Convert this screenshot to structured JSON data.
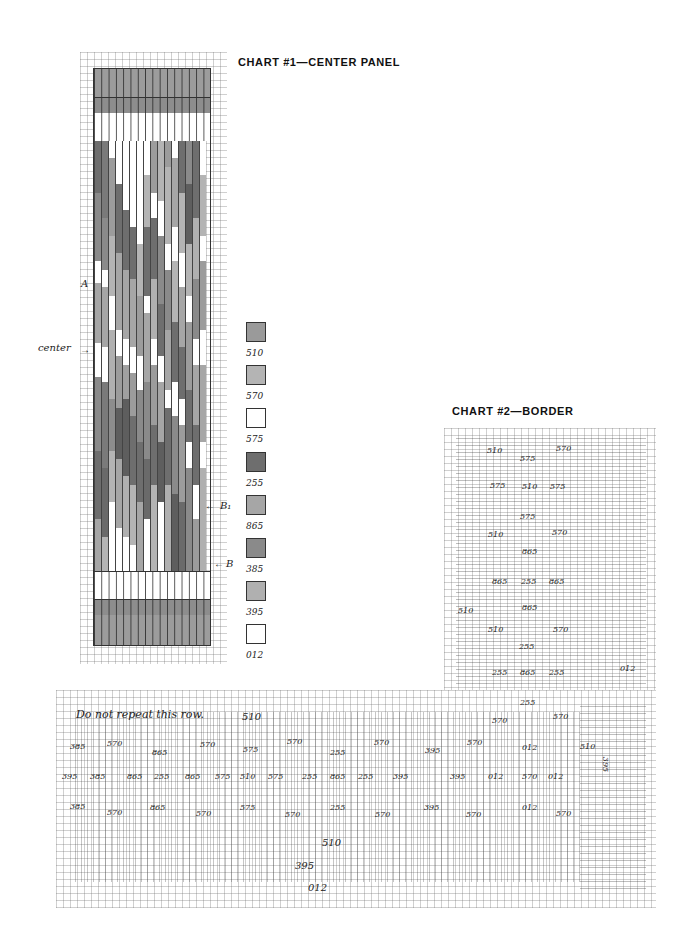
{
  "chart1": {
    "title": "CHART #1—CENTER PANEL",
    "annotations": {
      "center": "center",
      "a": "A",
      "b1": "B₁",
      "b": "B"
    },
    "legend": [
      {
        "code": "510",
        "color": "#9a9a9a"
      },
      {
        "code": "570",
        "color": "#b4b4b4"
      },
      {
        "code": "575",
        "color": "#ffffff"
      },
      {
        "code": "255",
        "color": "#6e6e6e"
      },
      {
        "code": "865",
        "color": "#a6a6a6"
      },
      {
        "code": "385",
        "color": "#8a8a8a"
      },
      {
        "code": "395",
        "color": "#b0b0b0"
      },
      {
        "code": "012",
        "color": "#ffffff"
      }
    ]
  },
  "chart2": {
    "title": "CHART #2—BORDER",
    "note": "Do not repeat this row.",
    "vertical_labels": [
      {
        "text": "510",
        "x": 487,
        "y": 452
      },
      {
        "text": "570",
        "x": 556,
        "y": 450
      },
      {
        "text": "575",
        "x": 520,
        "y": 460
      },
      {
        "text": "575",
        "x": 490,
        "y": 487
      },
      {
        "text": "510",
        "x": 522,
        "y": 488
      },
      {
        "text": "575",
        "x": 550,
        "y": 488
      },
      {
        "text": "575",
        "x": 520,
        "y": 518
      },
      {
        "text": "510",
        "x": 488,
        "y": 536
      },
      {
        "text": "570",
        "x": 552,
        "y": 534
      },
      {
        "text": "865",
        "x": 522,
        "y": 553
      },
      {
        "text": "865",
        "x": 492,
        "y": 583
      },
      {
        "text": "255",
        "x": 521,
        "y": 583
      },
      {
        "text": "865",
        "x": 549,
        "y": 583
      },
      {
        "text": "510",
        "x": 458,
        "y": 612
      },
      {
        "text": "865",
        "x": 522,
        "y": 609
      },
      {
        "text": "510",
        "x": 488,
        "y": 631
      },
      {
        "text": "570",
        "x": 553,
        "y": 631
      },
      {
        "text": "255",
        "x": 519,
        "y": 648
      },
      {
        "text": "255",
        "x": 492,
        "y": 674
      },
      {
        "text": "865",
        "x": 520,
        "y": 674
      },
      {
        "text": "255",
        "x": 549,
        "y": 674
      },
      {
        "text": "012",
        "x": 620,
        "y": 670
      },
      {
        "text": "255",
        "x": 520,
        "y": 704
      },
      {
        "text": "570",
        "x": 492,
        "y": 722
      },
      {
        "text": "570",
        "x": 553,
        "y": 718
      }
    ],
    "row_labels": {
      "top_510": "510",
      "row1": [
        "385",
        "570",
        "865",
        "570",
        "575",
        "570",
        "255",
        "570",
        "395",
        "570",
        "012",
        "510"
      ],
      "row2": [
        "395",
        "385",
        "865",
        "255",
        "865",
        "575",
        "510",
        "575",
        "255",
        "865",
        "255",
        "395",
        "395",
        "012",
        "570",
        "012"
      ],
      "row3": [
        "385",
        "570",
        "865",
        "570",
        "575",
        "570",
        "255",
        "570",
        "395",
        "570",
        "012",
        "570"
      ],
      "side": "395",
      "bottom": [
        "510",
        "395",
        "012"
      ]
    }
  }
}
